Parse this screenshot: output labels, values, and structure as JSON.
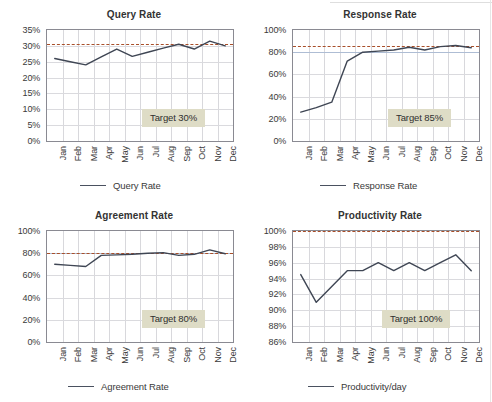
{
  "page": {
    "background_color": "#ffffff",
    "line_color": "#3f4654",
    "target_color": "#a84f2a",
    "badge_color": "#dedcc6",
    "grid_color": "#d8d8dc"
  },
  "months": [
    "Jan",
    "Feb",
    "Mar",
    "Apr",
    "May",
    "Jun",
    "Jul",
    "Aug",
    "Sep",
    "Oct",
    "Nov",
    "Dec"
  ],
  "chart_data": [
    {
      "type": "line",
      "id": "query-rate",
      "title": "Query Rate",
      "xlabel": "",
      "ylabel": "",
      "categories": [
        "Jan",
        "Feb",
        "Mar",
        "Apr",
        "May",
        "Jun",
        "Jul",
        "Aug",
        "Sep",
        "Oct",
        "Nov",
        "Dec"
      ],
      "series": [
        {
          "name": "Query Rate",
          "values": [
            26.0,
            25.0,
            24.0,
            26.5,
            29.0,
            26.7,
            28.0,
            29.3,
            30.5,
            29.0,
            31.5,
            30.0
          ]
        }
      ],
      "ylim": [
        0,
        35
      ],
      "yticks": [
        0,
        5,
        10,
        15,
        20,
        25,
        30,
        35
      ],
      "ytick_labels": [
        "0%",
        "5%",
        "10%",
        "15%",
        "20%",
        "25%",
        "30%",
        "35%"
      ],
      "target_value": 30.5,
      "target_label": "Target 30%",
      "legend_label": "Query Rate",
      "legend_position": "bottom",
      "grid": true
    },
    {
      "type": "line",
      "id": "response-rate",
      "title": "Response Rate",
      "xlabel": "",
      "ylabel": "",
      "categories": [
        "Jan",
        "Feb",
        "Mar",
        "Apr",
        "May",
        "Jun",
        "Jul",
        "Aug",
        "Sep",
        "Oct",
        "Nov",
        "Dec"
      ],
      "series": [
        {
          "name": "Response Rate",
          "values": [
            26.0,
            30.0,
            35.0,
            72.0,
            80.0,
            81.0,
            82.0,
            84.5,
            82.0,
            85.0,
            86.0,
            84.0
          ]
        }
      ],
      "ylim": [
        0,
        100
      ],
      "yticks": [
        0,
        20,
        40,
        60,
        80,
        100
      ],
      "ytick_labels": [
        "0%",
        "20%",
        "40%",
        "60%",
        "80%",
        "100%"
      ],
      "target_value": 86.0,
      "target_label": "Target 85%",
      "legend_label": "Response Rate",
      "legend_position": "bottom",
      "grid": true
    },
    {
      "type": "line",
      "id": "agreement-rate",
      "title": "Agreement Rate",
      "xlabel": "",
      "ylabel": "",
      "categories": [
        "Jan",
        "Feb",
        "Mar",
        "Apr",
        "May",
        "Jun",
        "Jul",
        "Aug",
        "Sep",
        "Oct",
        "Nov",
        "Dec"
      ],
      "series": [
        {
          "name": "Agreement Rate",
          "values": [
            70.0,
            69.0,
            68.0,
            78.0,
            78.5,
            79.0,
            80.0,
            80.5,
            78.0,
            79.0,
            83.0,
            79.5
          ]
        }
      ],
      "ylim": [
        0,
        100
      ],
      "yticks": [
        0,
        20,
        40,
        60,
        80,
        100
      ],
      "ytick_labels": [
        "0%",
        "20%",
        "40%",
        "60%",
        "80%",
        "100%"
      ],
      "target_value": 80.5,
      "target_label": "Target 80%",
      "legend_label": "Agreement Rate",
      "legend_position": "bottom",
      "grid": true
    },
    {
      "type": "line",
      "id": "productivity-rate",
      "title": "Productivity Rate",
      "xlabel": "",
      "ylabel": "",
      "categories": [
        "Jan",
        "Feb",
        "Mar",
        "Apr",
        "May",
        "Jun",
        "Jul",
        "Aug",
        "Sep",
        "Oct",
        "Nov",
        "Dec"
      ],
      "series": [
        {
          "name": "Productivity/day",
          "values": [
            94.5,
            91.0,
            93.0,
            95.0,
            95.0,
            96.0,
            95.0,
            96.0,
            95.0,
            96.0,
            97.0,
            95.0
          ]
        }
      ],
      "ylim": [
        86,
        100
      ],
      "yticks": [
        86,
        88,
        90,
        92,
        94,
        96,
        98,
        100
      ],
      "ytick_labels": [
        "86%",
        "88%",
        "90%",
        "92%",
        "94%",
        "96%",
        "98%",
        "100%"
      ],
      "target_value": 100.0,
      "target_label": "Target 100%",
      "legend_label": "Productivity/day",
      "legend_position": "bottom",
      "grid": true
    }
  ]
}
